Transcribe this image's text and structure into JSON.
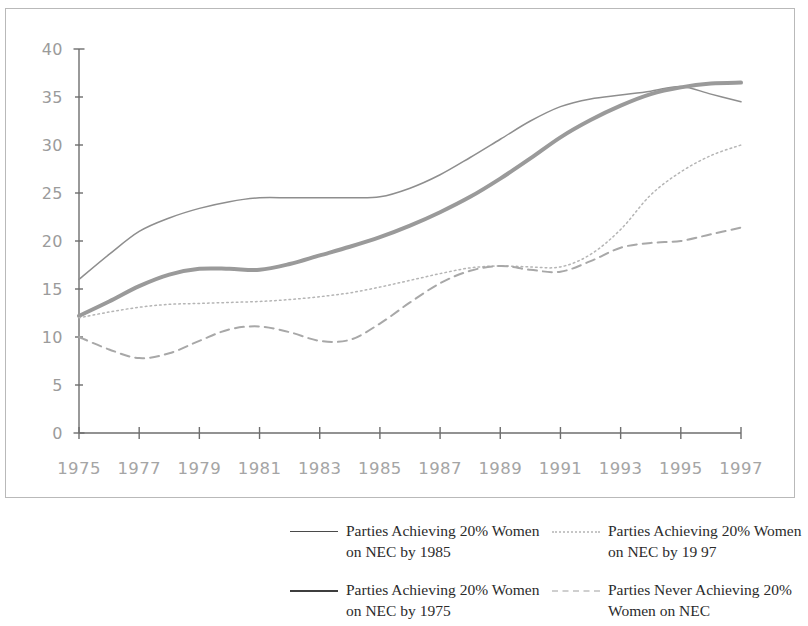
{
  "chart_data": {
    "type": "line",
    "title": "",
    "subtitle": "",
    "xlabel": "",
    "ylabel": "",
    "xlim": [
      1975,
      1997
    ],
    "ylim": [
      0,
      40
    ],
    "grid": false,
    "legend_position": "bottom",
    "y_ticks": [
      0,
      5,
      10,
      15,
      20,
      25,
      30,
      35,
      40
    ],
    "y_tick_labels": [
      "0",
      "5",
      "10",
      "15",
      "20",
      "25",
      "30",
      "35",
      "40"
    ],
    "x": [
      1975,
      1976,
      1977,
      1978,
      1979,
      1980,
      1981,
      1982,
      1983,
      1984,
      1985,
      1986,
      1987,
      1988,
      1989,
      1990,
      1991,
      1992,
      1993,
      1994,
      1995,
      1996,
      1997
    ],
    "x_ticks": [
      1975,
      1977,
      1979,
      1981,
      1983,
      1985,
      1987,
      1989,
      1991,
      1993,
      1995,
      1997
    ],
    "x_tick_labels": [
      "1975",
      "1977",
      "1979",
      "1981",
      "1983",
      "1985",
      "1987",
      "1989",
      "1991",
      "1993",
      "1995",
      "1997"
    ],
    "series": [
      {
        "name": "Parties Achieving 20% Women on NEC by 1985",
        "style": "solid-thin",
        "color": "#8e8e8e",
        "values": [
          16.0,
          18.6,
          21.0,
          22.4,
          23.4,
          24.1,
          24.5,
          24.5,
          24.5,
          24.5,
          24.6,
          25.5,
          26.9,
          28.7,
          30.6,
          32.5,
          34.0,
          34.8,
          35.2,
          35.6,
          36.1,
          35.3,
          34.5
        ]
      },
      {
        "name": "Parties Achieving 20% Women on NEC by 1975",
        "style": "solid-thick",
        "color": "#9a9a9a",
        "values": [
          12.2,
          13.7,
          15.3,
          16.5,
          17.1,
          17.1,
          17.0,
          17.6,
          18.5,
          19.4,
          20.4,
          21.6,
          23.0,
          24.6,
          26.5,
          28.6,
          30.8,
          32.6,
          34.1,
          35.3,
          36.0,
          36.4,
          36.5
        ]
      },
      {
        "name": "Parties Achieving 20% Women on NEC by 1997",
        "style": "dotted",
        "color": "#b5b5b5",
        "values": [
          12.0,
          12.6,
          13.1,
          13.4,
          13.5,
          13.6,
          13.7,
          13.9,
          14.2,
          14.6,
          15.2,
          15.9,
          16.6,
          17.2,
          17.4,
          17.3,
          17.3,
          18.6,
          21.2,
          24.8,
          27.2,
          28.9,
          30.0
        ]
      },
      {
        "name": "Parties Never Achieving 20% Women on NEC",
        "style": "dashed",
        "color": "#a8a8a8",
        "values": [
          10.0,
          8.7,
          7.8,
          8.3,
          9.6,
          10.8,
          11.1,
          10.5,
          9.6,
          9.7,
          11.4,
          13.6,
          15.6,
          16.9,
          17.4,
          17.0,
          16.8,
          17.9,
          19.3,
          19.8,
          20.0,
          20.7,
          21.4
        ]
      }
    ]
  },
  "legend": {
    "entries": [
      {
        "swatch": "solid-thin",
        "line1": "Parties Achieving 20% Women",
        "line2": "on NEC by 1985",
        "text": "Parties Achieving 20% Women on NEC by 1985"
      },
      {
        "swatch": "solid-thick",
        "line1": "Parties Achieving 20% Women",
        "line2": "on NEC by 1975",
        "text": "Parties Achieving 20% Women on NEC by 1975"
      },
      {
        "swatch": "dotted",
        "line1": "Parties Achieving 20% Women",
        "line2": "on NEC by 19 97",
        "text": "Parties Achieving 20% Women on NEC by 19 97"
      },
      {
        "swatch": "dashed",
        "line1": "Parties Never Achieving 20%",
        "line2": "Women on NEC",
        "text": "Parties Never Achieving 20% Women on NEC"
      }
    ]
  },
  "colors": {
    "frame_border": "#b9b9b9",
    "axis": "#6e6e6e",
    "tick_text": "#9b9b9b",
    "legend_text": "#2b2b2b",
    "background": "#ffffff"
  }
}
